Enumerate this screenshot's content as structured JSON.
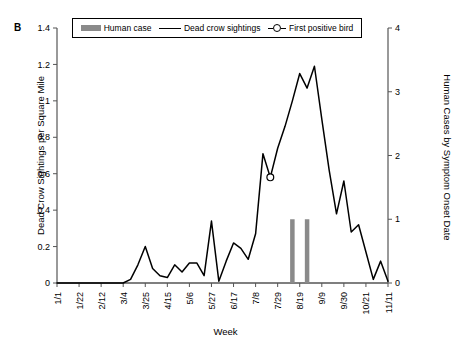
{
  "panel": {
    "label": "B"
  },
  "legend": {
    "items": [
      {
        "name": "human-case",
        "label": "Human case",
        "marker": "bar",
        "color": "#8a8a8a"
      },
      {
        "name": "dead-crow-sightings",
        "label": "Dead crow sightings",
        "marker": "line",
        "color": "#000000"
      },
      {
        "name": "first-positive-bird",
        "label": "First positive bird",
        "marker": "circle",
        "color": "#000000"
      }
    ]
  },
  "axes": {
    "x_title": "Week",
    "y_left_title": "Dead Crow Sightings per Square Mile",
    "y_right_title": "Human Cases by Symptom Onset Date",
    "y_left_ticks": [
      "0",
      "0.2",
      "0.4",
      "0.6",
      "0.8",
      "1",
      "1.2",
      "1.4"
    ],
    "y_right_ticks": [
      "0",
      "1",
      "2",
      "3",
      "4"
    ],
    "x_ticks": [
      "1/1",
      "1/22",
      "2/12",
      "3/4",
      "3/25",
      "4/15",
      "5/6",
      "5/27",
      "6/17",
      "7/8",
      "7/29",
      "8/19",
      "9/9",
      "9/30",
      "10/21",
      "11/11"
    ]
  },
  "chart_data": {
    "type": "line",
    "title": "",
    "subtitle": "",
    "xlabel": "Week",
    "ylabel": "Dead Crow Sightings per Square Mile",
    "ylabel_secondary": "Human Cases by Symptom Onset Date",
    "ylim": [
      0,
      1.4
    ],
    "ylim_secondary": [
      0,
      4
    ],
    "grid": false,
    "legend_position": "top",
    "x": [
      "1/1",
      "1/8",
      "1/15",
      "1/22",
      "1/29",
      "2/5",
      "2/12",
      "2/19",
      "2/26",
      "3/4",
      "3/11",
      "3/18",
      "3/25",
      "4/1",
      "4/8",
      "4/15",
      "4/22",
      "4/29",
      "5/6",
      "5/13",
      "5/20",
      "5/27",
      "6/3",
      "6/10",
      "6/17",
      "6/24",
      "7/1",
      "7/8",
      "7/15",
      "7/22",
      "7/29",
      "8/5",
      "8/12",
      "8/19",
      "8/26",
      "9/2",
      "9/9",
      "9/16",
      "9/23",
      "9/30",
      "10/7",
      "10/14",
      "10/21",
      "10/28",
      "11/4",
      "11/11"
    ],
    "x_tick_labels": [
      "1/1",
      "1/22",
      "2/12",
      "3/4",
      "3/25",
      "4/15",
      "5/6",
      "5/27",
      "6/17",
      "7/8",
      "7/29",
      "8/19",
      "9/9",
      "9/30",
      "10/21",
      "11/11"
    ],
    "x_tick_every": 3,
    "series": [
      {
        "name": "Dead crow sightings",
        "axis": "left",
        "type": "line",
        "color": "#000000",
        "values": [
          0,
          0,
          0,
          0,
          0,
          0,
          0,
          0,
          0,
          0,
          0.02,
          0.1,
          0.2,
          0.08,
          0.04,
          0.03,
          0.1,
          0.06,
          0.11,
          0.11,
          0.04,
          0.34,
          0.01,
          0.12,
          0.22,
          0.19,
          0.13,
          0.27,
          0.71,
          0.58,
          0.74,
          0.86,
          1.0,
          1.15,
          1.07,
          1.19,
          0.9,
          0.62,
          0.38,
          0.56,
          0.28,
          0.32,
          0.17,
          0.02,
          0.12,
          0.01
        ]
      },
      {
        "name": "Human case",
        "axis": "right",
        "type": "bar",
        "color": "#8a8a8a",
        "values": [
          0,
          0,
          0,
          0,
          0,
          0,
          0,
          0,
          0,
          0,
          0,
          0,
          0,
          0,
          0,
          0,
          0,
          0,
          0,
          0,
          0,
          0,
          0,
          0,
          0,
          0,
          0,
          0,
          0,
          0,
          0,
          0,
          1,
          0,
          1,
          0,
          0,
          0,
          0,
          0,
          0,
          0,
          0,
          0,
          0,
          0
        ]
      }
    ],
    "annotations": [
      {
        "name": "First positive bird",
        "marker": "open-circle",
        "x": "7/22",
        "x_index": 29,
        "y": 0.58,
        "axis": "left"
      }
    ]
  }
}
